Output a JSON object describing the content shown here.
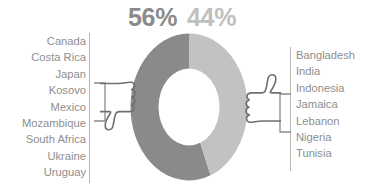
{
  "header": {
    "left_percent": "56%",
    "right_percent": "44%"
  },
  "colors": {
    "negative_segment": "#8a8a8a",
    "positive_segment": "#c2c2c2",
    "label_text": "#8e8e8e",
    "rule": "#b6b6b6",
    "ink": "#6f6f6f",
    "background": "#ffffff"
  },
  "left_group": {
    "icon": "thumbs-down-icon",
    "percent": "56%",
    "items": [
      "Canada",
      "Costa Rica",
      "Japan",
      "Kosovo",
      "Mexico",
      "Mozambique",
      "South Africa",
      "Ukraine",
      "Uruguay"
    ]
  },
  "right_group": {
    "icon": "thumbs-up-icon",
    "percent": "44%",
    "items": [
      "Bangladesh",
      "India",
      "Indonesia",
      "Jamaica",
      "Lebanon",
      "Nigeria",
      "Tunisia"
    ]
  },
  "chart_data": {
    "type": "pie",
    "title": "",
    "subtype": "donut",
    "labels": [
      "56%",
      "44%"
    ],
    "values": [
      56,
      44
    ],
    "colors": [
      "#8a8a8a",
      "#c2c2c2"
    ],
    "start_angle_deg": 0,
    "direction": "counterclockwise",
    "inner_radius_ratio": 0.52,
    "legend": "side-lists",
    "grid": false,
    "annotations": [
      {
        "icon": "thumbs-down-icon",
        "side": "left",
        "value": 56,
        "countries": [
          "Canada",
          "Costa Rica",
          "Japan",
          "Kosovo",
          "Mexico",
          "Mozambique",
          "South Africa",
          "Ukraine",
          "Uruguay"
        ]
      },
      {
        "icon": "thumbs-up-icon",
        "side": "right",
        "value": 44,
        "countries": [
          "Bangladesh",
          "India",
          "Indonesia",
          "Jamaica",
          "Lebanon",
          "Nigeria",
          "Tunisia"
        ]
      }
    ]
  }
}
